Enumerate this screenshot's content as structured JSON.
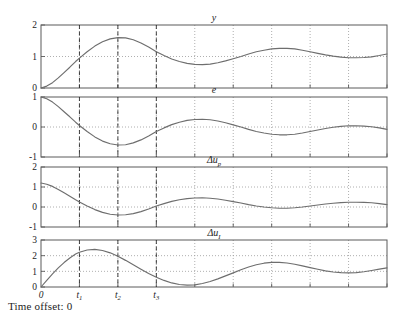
{
  "figure": {
    "footer_label": "Time offset: 0",
    "geometry": {
      "plot_left": 41,
      "plot_right": 387,
      "x_tick_step": 38.4
    }
  },
  "chart_data": [
    {
      "type": "line",
      "title": "y",
      "title_plain": "y",
      "xlabel": "",
      "ylabel": "",
      "ylim": [
        0,
        2
      ],
      "yticks": [
        0,
        1,
        2
      ],
      "ytick_labels": [
        "0",
        "1",
        "2"
      ],
      "xlim": [
        0,
        9
      ],
      "xticks": [
        0,
        1,
        2,
        3,
        4,
        5,
        6,
        7,
        8,
        9
      ],
      "xtick_labels": [
        "",
        "",
        "",
        "",
        "",
        "",
        "",
        "",
        "",
        ""
      ],
      "grid": true,
      "gridlines_y": [
        1
      ],
      "vlines": [
        1,
        2,
        3
      ],
      "vline_labels": [
        "t1",
        "t2",
        "t3"
      ],
      "x": [
        0,
        0.15,
        0.3,
        0.45,
        0.6,
        0.75,
        0.9,
        1.0,
        1.2,
        1.4,
        1.6,
        1.8,
        2.0,
        2.2,
        2.4,
        2.6,
        2.8,
        3.0,
        3.2,
        3.4,
        3.6,
        3.8,
        4.0,
        4.2,
        4.4,
        4.6,
        4.8,
        5.0,
        5.2,
        5.4,
        5.6,
        5.8,
        6.0,
        6.2,
        6.4,
        6.6,
        6.8,
        7.0,
        7.2,
        7.4,
        7.6,
        7.8,
        8.0,
        8.2,
        8.4,
        8.6,
        8.8,
        9.0
      ],
      "y": [
        0.0,
        0.06,
        0.17,
        0.32,
        0.49,
        0.66,
        0.84,
        0.95,
        1.15,
        1.33,
        1.47,
        1.56,
        1.6,
        1.59,
        1.53,
        1.43,
        1.3,
        1.15,
        1.03,
        0.92,
        0.84,
        0.78,
        0.75,
        0.74,
        0.76,
        0.8,
        0.86,
        0.93,
        1.0,
        1.08,
        1.15,
        1.2,
        1.24,
        1.26,
        1.26,
        1.24,
        1.2,
        1.15,
        1.1,
        1.05,
        1.01,
        0.98,
        0.96,
        0.96,
        0.97,
        0.99,
        1.03,
        1.08
      ]
    },
    {
      "type": "line",
      "title": "e",
      "title_plain": "e",
      "xlabel": "",
      "ylabel": "",
      "ylim": [
        -1,
        1
      ],
      "yticks": [
        -1,
        0,
        1
      ],
      "ytick_labels": [
        "-1",
        "0",
        "1"
      ],
      "xlim": [
        0,
        9
      ],
      "xticks": [
        0,
        1,
        2,
        3,
        4,
        5,
        6,
        7,
        8,
        9
      ],
      "grid": true,
      "gridlines_y": [
        0
      ],
      "vlines": [
        1,
        2,
        3
      ],
      "x": [
        0,
        0.15,
        0.3,
        0.45,
        0.6,
        0.75,
        0.9,
        1.0,
        1.2,
        1.4,
        1.6,
        1.8,
        2.0,
        2.2,
        2.4,
        2.6,
        2.8,
        3.0,
        3.2,
        3.4,
        3.6,
        3.8,
        4.0,
        4.2,
        4.4,
        4.6,
        4.8,
        5.0,
        5.2,
        5.4,
        5.6,
        5.8,
        6.0,
        6.2,
        6.4,
        6.6,
        6.8,
        7.0,
        7.2,
        7.4,
        7.6,
        7.8,
        8.0,
        8.2,
        8.4,
        8.6,
        8.8,
        9.0
      ],
      "y": [
        1.0,
        0.94,
        0.83,
        0.68,
        0.51,
        0.34,
        0.16,
        0.05,
        -0.15,
        -0.33,
        -0.47,
        -0.56,
        -0.6,
        -0.59,
        -0.53,
        -0.43,
        -0.3,
        -0.15,
        -0.03,
        0.08,
        0.16,
        0.22,
        0.25,
        0.26,
        0.24,
        0.2,
        0.14,
        0.07,
        0.0,
        -0.08,
        -0.15,
        -0.2,
        -0.24,
        -0.26,
        -0.26,
        -0.24,
        -0.2,
        -0.15,
        -0.1,
        -0.05,
        -0.01,
        0.02,
        0.04,
        0.04,
        0.03,
        0.01,
        -0.03,
        -0.08
      ]
    },
    {
      "type": "line",
      "title": "Δu_p",
      "title_plain": "Δu",
      "title_sub": "p",
      "xlabel": "",
      "ylabel": "",
      "ylim": [
        -1,
        2
      ],
      "yticks": [
        -1,
        0,
        1,
        2
      ],
      "ytick_labels": [
        "-1",
        "0",
        "1",
        "2"
      ],
      "xlim": [
        0,
        9
      ],
      "xticks": [
        0,
        1,
        2,
        3,
        4,
        5,
        6,
        7,
        8,
        9
      ],
      "grid": true,
      "gridlines_y": [
        0,
        1
      ],
      "vlines": [
        1,
        2,
        3
      ],
      "x": [
        0,
        0.15,
        0.3,
        0.45,
        0.6,
        0.75,
        0.9,
        1.0,
        1.2,
        1.4,
        1.6,
        1.8,
        2.0,
        2.2,
        2.4,
        2.6,
        2.8,
        3.0,
        3.2,
        3.4,
        3.6,
        3.8,
        4.0,
        4.2,
        4.4,
        4.6,
        4.8,
        5.0,
        5.2,
        5.4,
        5.6,
        5.8,
        6.0,
        6.2,
        6.4,
        6.6,
        6.8,
        7.0,
        7.2,
        7.4,
        7.6,
        7.8,
        8.0,
        8.2,
        8.4,
        8.6,
        8.8,
        9.0
      ],
      "y": [
        1.2,
        1.14,
        1.03,
        0.88,
        0.71,
        0.54,
        0.36,
        0.25,
        0.05,
        -0.13,
        -0.27,
        -0.36,
        -0.4,
        -0.39,
        -0.33,
        -0.23,
        -0.1,
        0.05,
        0.17,
        0.28,
        0.36,
        0.42,
        0.45,
        0.46,
        0.44,
        0.4,
        0.34,
        0.27,
        0.2,
        0.12,
        0.05,
        0.0,
        -0.04,
        -0.06,
        -0.06,
        -0.04,
        0.0,
        0.05,
        0.1,
        0.15,
        0.19,
        0.22,
        0.24,
        0.24,
        0.23,
        0.21,
        0.17,
        0.12
      ]
    },
    {
      "type": "line",
      "title": "Δu_I",
      "title_plain": "Δu",
      "title_sub": "I",
      "xlabel": "",
      "ylabel": "",
      "ylim": [
        0,
        3
      ],
      "yticks": [
        0,
        1,
        2,
        3
      ],
      "ytick_labels": [
        "0",
        "1",
        "2",
        "3"
      ],
      "xlim": [
        0,
        9
      ],
      "xticks": [
        0,
        1,
        2,
        3,
        4,
        5,
        6,
        7,
        8,
        9
      ],
      "xtick_labels": [
        "0",
        "t1",
        "t2",
        "t3",
        "",
        "",
        "",
        "",
        "",
        ""
      ],
      "grid": true,
      "gridlines_y": [
        1,
        2
      ],
      "vlines": [
        1,
        2,
        3
      ],
      "x": [
        0,
        0.15,
        0.3,
        0.45,
        0.6,
        0.75,
        0.9,
        1.0,
        1.2,
        1.4,
        1.6,
        1.8,
        2.0,
        2.2,
        2.4,
        2.6,
        2.8,
        3.0,
        3.2,
        3.4,
        3.6,
        3.8,
        4.0,
        4.2,
        4.4,
        4.6,
        4.8,
        5.0,
        5.2,
        5.4,
        5.6,
        5.8,
        6.0,
        6.2,
        6.4,
        6.6,
        6.8,
        7.0,
        7.2,
        7.4,
        7.6,
        7.8,
        8.0,
        8.2,
        8.4,
        8.6,
        8.8,
        9.0
      ],
      "y": [
        0.0,
        0.43,
        0.84,
        1.22,
        1.56,
        1.85,
        2.1,
        2.22,
        2.36,
        2.4,
        2.33,
        2.18,
        1.96,
        1.7,
        1.42,
        1.14,
        0.86,
        0.62,
        0.42,
        0.26,
        0.16,
        0.12,
        0.14,
        0.22,
        0.35,
        0.52,
        0.71,
        0.9,
        1.1,
        1.28,
        1.42,
        1.52,
        1.57,
        1.57,
        1.53,
        1.45,
        1.35,
        1.24,
        1.13,
        1.03,
        0.96,
        0.92,
        0.9,
        0.92,
        0.97,
        1.05,
        1.14,
        1.22
      ]
    }
  ],
  "axis_labels": {
    "t1": "t",
    "t1_sub": "1",
    "t2": "t",
    "t2_sub": "2",
    "t3": "t",
    "t3_sub": "3",
    "zero": "0"
  }
}
